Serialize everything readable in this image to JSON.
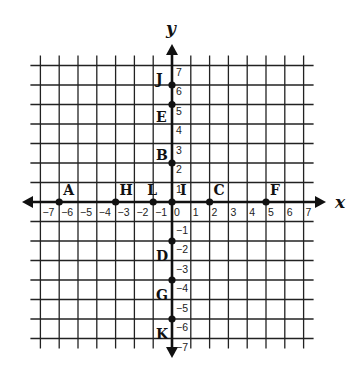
{
  "axes": {
    "x_label": "x",
    "y_label": "y",
    "x_range": [
      -7,
      7
    ],
    "y_range": [
      -7,
      7
    ],
    "x_ticks": [
      "−7",
      "−6",
      "−5",
      "−4",
      "−3",
      "−2",
      "−1",
      "0",
      "1",
      "2",
      "3",
      "4",
      "5",
      "6",
      "7"
    ],
    "y_ticks": [
      "7",
      "6",
      "5",
      "4",
      "3",
      "2",
      "1",
      "−1",
      "−2",
      "−3",
      "−4",
      "−5",
      "−6",
      "−7"
    ]
  },
  "points": [
    {
      "label": "A",
      "x": -6,
      "y": 0
    },
    {
      "label": "H",
      "x": -3,
      "y": 0
    },
    {
      "label": "L",
      "x": -1,
      "y": 0
    },
    {
      "label": "I",
      "x": 0,
      "y": 0
    },
    {
      "label": "C",
      "x": 2,
      "y": 0
    },
    {
      "label": "F",
      "x": 5,
      "y": 0
    },
    {
      "label": "J",
      "x": 0,
      "y": 6
    },
    {
      "label": "E",
      "x": 0,
      "y": 5
    },
    {
      "label": "B",
      "x": 0,
      "y": 2
    },
    {
      "label": "D",
      "x": 0,
      "y": -2
    },
    {
      "label": "G",
      "x": 0,
      "y": -4
    },
    {
      "label": "K",
      "x": 0,
      "y": -6
    }
  ],
  "colors": {
    "grid": "#222222",
    "axis": "#111111",
    "point": "#111111",
    "background": "#ffffff"
  }
}
